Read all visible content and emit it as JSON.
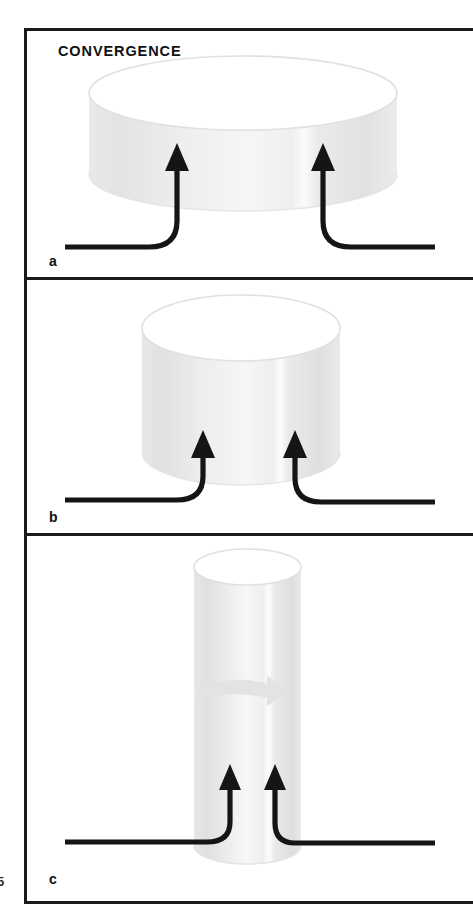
{
  "figure": {
    "title": "CONVERGENCE",
    "page_number_fragment": "5",
    "frame_color": "#1a1a1a",
    "background_color": "#ffffff"
  },
  "panels": [
    {
      "label": "a",
      "icon_cylinder": "cylinder-wide-flat",
      "icon_arrow_left": "flow-arrow-up-left",
      "icon_arrow_right": "flow-arrow-up-right",
      "description": "Wide flat disc with two converging inflow arrows"
    },
    {
      "label": "b",
      "icon_cylinder": "cylinder-medium",
      "icon_arrow_left": "flow-arrow-up-left",
      "icon_arrow_right": "flow-arrow-up-right",
      "description": "Medium cylinder with two converging inflow arrows"
    },
    {
      "label": "c",
      "icon_cylinder": "cylinder-tall-narrow",
      "icon_arrow_left": "flow-arrow-up-left",
      "icon_arrow_right": "flow-arrow-up-right",
      "icon_arrow_inner": "outflow-arrow-right",
      "description": "Tall narrow cylinder with converging inflow arrows and a lateral outflow arrow"
    }
  ],
  "colors": {
    "cylinder_top": "#ffffff",
    "cylinder_body_light": "#f3f3f3",
    "cylinder_body_mid": "#e6e6e6",
    "cylinder_body_shadow": "#dddddd",
    "cylinder_outline": "#e2e2e2",
    "arrow_dark": "#151515",
    "arrow_gray": "#e2e2e2"
  }
}
